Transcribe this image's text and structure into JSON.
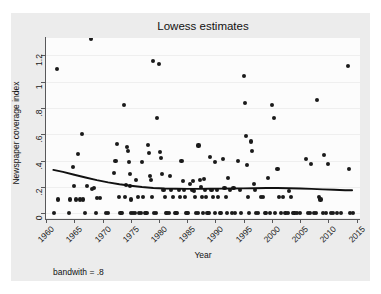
{
  "chart_data": {
    "type": "scatter",
    "title": "Lowess estimates",
    "xlabel": "Year",
    "ylabel": "Newspaper coverage index",
    "note": "bandwith = .8",
    "xlim": [
      1960,
      2015.6
    ],
    "ylim": [
      -0.035,
      1.33
    ],
    "grid": true,
    "legend": null,
    "xticks": [
      1960,
      1965,
      1970,
      1975,
      1980,
      1985,
      1990,
      1995,
      2000,
      2005,
      2010,
      2015
    ],
    "xtick_labels": [
      "1960",
      "1965",
      "1970",
      "1975",
      "1980",
      "1985",
      "1990",
      "1995",
      "2000",
      "2005",
      "2010",
      "2015"
    ],
    "yticks": [
      0,
      0.2,
      0.4,
      0.6,
      0.8,
      1,
      1.2
    ],
    "ytick_labels": [
      "0",
      ".2",
      ".4",
      ".6",
      ".8",
      "1",
      "1.2"
    ],
    "marker_color": "#1a1a1a",
    "line_color": "#111111",
    "plot_bg": "#fcfcfc",
    "graph_bg": "#ececec",
    "series": [
      {
        "name": "Newspaper coverage index",
        "type": "scatter",
        "points": [
          [
            1961.4,
            0.0
          ],
          [
            1962.0,
            1.095
          ],
          [
            1962.2,
            0.105
          ],
          [
            1964.0,
            0.0
          ],
          [
            1964.3,
            0.105
          ],
          [
            1964.8,
            0.355
          ],
          [
            1965.0,
            0.21
          ],
          [
            1965.3,
            0.105
          ],
          [
            1965.7,
            0.45
          ],
          [
            1966.0,
            0.105
          ],
          [
            1966.3,
            0.6
          ],
          [
            1966.6,
            0.105
          ],
          [
            1966.9,
            0.0
          ],
          [
            1967.2,
            0.21
          ],
          [
            1968.0,
            1.32
          ],
          [
            1968.2,
            0.185
          ],
          [
            1968.5,
            0.19
          ],
          [
            1968.8,
            0.0
          ],
          [
            1969.1,
            0.115
          ],
          [
            1969.5,
            0.115
          ],
          [
            1970.6,
            0.0
          ],
          [
            1971.0,
            0.0
          ],
          [
            1972.0,
            0.305
          ],
          [
            1972.3,
            0.4
          ],
          [
            1972.6,
            0.525
          ],
          [
            1972.9,
            0.125
          ],
          [
            1973.2,
            0.0
          ],
          [
            1973.5,
            0.0
          ],
          [
            1973.8,
            0.825
          ],
          [
            1974.0,
            0.125
          ],
          [
            1974.2,
            0.215
          ],
          [
            1974.4,
            0.505
          ],
          [
            1974.5,
            0.47
          ],
          [
            1974.7,
            0.39
          ],
          [
            1974.8,
            0.3
          ],
          [
            1974.9,
            0.21
          ],
          [
            1975.0,
            0.105
          ],
          [
            1975.1,
            0.0
          ],
          [
            1975.4,
            0.0
          ],
          [
            1975.7,
            0.0
          ],
          [
            1976.0,
            0.255
          ],
          [
            1976.3,
            0.125
          ],
          [
            1976.5,
            0.0
          ],
          [
            1976.8,
            0.0
          ],
          [
            1977.0,
            0.39
          ],
          [
            1977.2,
            0.125
          ],
          [
            1977.5,
            0.0
          ],
          [
            1977.8,
            0.0
          ],
          [
            1978.0,
            0.52
          ],
          [
            1978.2,
            0.455
          ],
          [
            1978.4,
            0.285
          ],
          [
            1978.6,
            0.25
          ],
          [
            1978.8,
            0.125
          ],
          [
            1979.0,
            1.155
          ],
          [
            1979.2,
            0.0
          ],
          [
            1979.4,
            0.0
          ],
          [
            1979.7,
            0.72
          ],
          [
            1980.0,
            1.135
          ],
          [
            1980.2,
            0.465
          ],
          [
            1980.4,
            0.42
          ],
          [
            1980.6,
            0.3
          ],
          [
            1980.8,
            0.175
          ],
          [
            1981.0,
            0.125
          ],
          [
            1981.2,
            0.0
          ],
          [
            1981.4,
            0.0
          ],
          [
            1981.7,
            0.0
          ],
          [
            1982.0,
            0.285
          ],
          [
            1982.2,
            0.175
          ],
          [
            1982.5,
            0.125
          ],
          [
            1982.8,
            0.0
          ],
          [
            1983.0,
            0.0
          ],
          [
            1983.2,
            0.0
          ],
          [
            1983.5,
            0.175
          ],
          [
            1983.8,
            0.125
          ],
          [
            1984.0,
            0.4
          ],
          [
            1984.2,
            0.245
          ],
          [
            1984.4,
            0.175
          ],
          [
            1984.6,
            0.125
          ],
          [
            1984.8,
            0.0
          ],
          [
            1985.0,
            0.0
          ],
          [
            1985.2,
            0.0
          ],
          [
            1985.5,
            0.22
          ],
          [
            1985.8,
            0.175
          ],
          [
            1986.0,
            0.245
          ],
          [
            1986.2,
            0.17
          ],
          [
            1986.4,
            0.125
          ],
          [
            1986.6,
            0.0
          ],
          [
            1986.9,
            0.0
          ],
          [
            1987.0,
            0.515
          ],
          [
            1987.2,
            0.255
          ],
          [
            1987.4,
            0.2
          ],
          [
            1987.6,
            0.125
          ],
          [
            1987.8,
            0.0
          ],
          [
            1988.0,
            0.26
          ],
          [
            1988.2,
            0.175
          ],
          [
            1988.4,
            0.125
          ],
          [
            1988.6,
            0.0
          ],
          [
            1988.9,
            0.0
          ],
          [
            1989.0,
            0.43
          ],
          [
            1989.3,
            0.175
          ],
          [
            1989.6,
            0.125
          ],
          [
            1989.9,
            0.0
          ],
          [
            1990.0,
            0.39
          ],
          [
            1990.2,
            0.175
          ],
          [
            1990.5,
            0.125
          ],
          [
            1990.8,
            0.0
          ],
          [
            1991.0,
            0.0
          ],
          [
            1991.3,
            0.41
          ],
          [
            1991.6,
            0.19
          ],
          [
            1991.9,
            0.125
          ],
          [
            1992.0,
            0.0
          ],
          [
            1992.3,
            0.27
          ],
          [
            1992.6,
            0.175
          ],
          [
            1992.9,
            0.0
          ],
          [
            1993.2,
            0.19
          ],
          [
            1993.5,
            0.0
          ],
          [
            1994.0,
            0.4
          ],
          [
            1994.3,
            0.18
          ],
          [
            1994.6,
            0.0
          ],
          [
            1995.0,
            1.04
          ],
          [
            1995.2,
            0.84
          ],
          [
            1995.4,
            0.585
          ],
          [
            1995.6,
            0.37
          ],
          [
            1995.8,
            0.125
          ],
          [
            1996.0,
            0.0
          ],
          [
            1996.3,
            0.545
          ],
          [
            1996.5,
            0.47
          ],
          [
            1996.8,
            0.22
          ],
          [
            1997.0,
            0.175
          ],
          [
            1997.2,
            0.0
          ],
          [
            1997.5,
            0.0
          ],
          [
            1998.0,
            0.125
          ],
          [
            1998.4,
            0.125
          ],
          [
            1998.8,
            0.0
          ],
          [
            1999.0,
            0.0
          ],
          [
            1999.3,
            0.265
          ],
          [
            1999.6,
            0.0
          ],
          [
            2000.0,
            0.82
          ],
          [
            2000.3,
            0.72
          ],
          [
            2000.6,
            0.0
          ],
          [
            2001.0,
            0.335
          ],
          [
            2001.3,
            0.125
          ],
          [
            2001.6,
            0.0
          ],
          [
            2002.0,
            0.125
          ],
          [
            2002.4,
            0.0
          ],
          [
            2002.8,
            0.0
          ],
          [
            2003.0,
            0.17
          ],
          [
            2003.4,
            0.125
          ],
          [
            2003.8,
            0.0
          ],
          [
            2004.0,
            0.0
          ],
          [
            2004.5,
            0.0
          ],
          [
            2005.0,
            0.0
          ],
          [
            2006.0,
            0.415
          ],
          [
            2006.4,
            0.0
          ],
          [
            2006.8,
            0.0
          ],
          [
            2007.0,
            0.375
          ],
          [
            2007.4,
            0.0
          ],
          [
            2007.8,
            0.0
          ],
          [
            2008.0,
            0.86
          ],
          [
            2008.3,
            0.125
          ],
          [
            2008.6,
            0.105
          ],
          [
            2009.0,
            0.0
          ],
          [
            2009.3,
            0.44
          ],
          [
            2009.6,
            0.0
          ],
          [
            2010.0,
            0.375
          ],
          [
            2010.4,
            0.0
          ],
          [
            2010.8,
            0.0
          ],
          [
            2011.5,
            0.0
          ],
          [
            2012.2,
            0.0
          ],
          [
            2013.5,
            1.12
          ],
          [
            2013.7,
            0.335
          ],
          [
            2013.9,
            0.0
          ],
          [
            2014.3,
            0.0
          ]
        ]
      },
      {
        "name": "Lowess smoothed fit",
        "type": "line",
        "points": [
          [
            1961.3,
            0.33
          ],
          [
            1963.0,
            0.315
          ],
          [
            1965.0,
            0.293
          ],
          [
            1967.0,
            0.272
          ],
          [
            1969.0,
            0.252
          ],
          [
            1971.0,
            0.235
          ],
          [
            1973.0,
            0.221
          ],
          [
            1975.0,
            0.21
          ],
          [
            1977.0,
            0.2
          ],
          [
            1979.0,
            0.193
          ],
          [
            1981.0,
            0.189
          ],
          [
            1983.0,
            0.187
          ],
          [
            1985.0,
            0.186
          ],
          [
            1987.0,
            0.186
          ],
          [
            1989.0,
            0.187
          ],
          [
            1991.0,
            0.188
          ],
          [
            1993.0,
            0.189
          ],
          [
            1995.0,
            0.19
          ],
          [
            1997.0,
            0.191
          ],
          [
            1999.0,
            0.192
          ],
          [
            2001.0,
            0.192
          ],
          [
            2003.0,
            0.191
          ],
          [
            2005.0,
            0.189
          ],
          [
            2007.0,
            0.186
          ],
          [
            2009.0,
            0.182
          ],
          [
            2011.0,
            0.179
          ],
          [
            2013.0,
            0.176
          ],
          [
            2014.2,
            0.175
          ]
        ]
      }
    ]
  }
}
